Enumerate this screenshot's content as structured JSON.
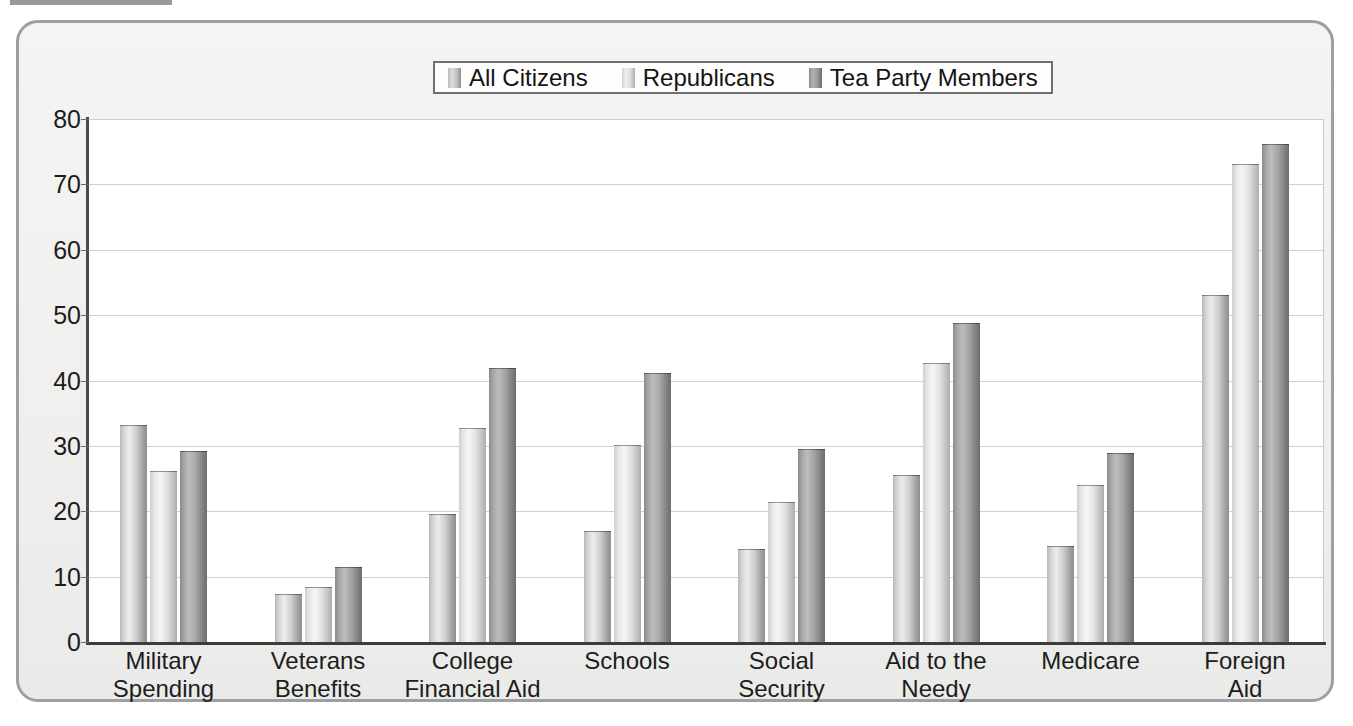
{
  "chart_data": {
    "type": "bar",
    "title": "",
    "xlabel": "",
    "ylabel": "",
    "ylim": [
      0,
      80
    ],
    "yticks": [
      0,
      10,
      20,
      30,
      40,
      50,
      60,
      70,
      80
    ],
    "grid": true,
    "legend_position": "top-center",
    "categories": [
      "Military\nSpending",
      "Veterans\nBenefits",
      "College\nFinancial Aid",
      "Schools",
      "Social\nSecurity",
      "Aid to the\nNeedy",
      "Medicare",
      "Foreign\nAid"
    ],
    "category_labels": [
      {
        "line1": "Military",
        "line2": "Spending"
      },
      {
        "line1": "Veterans",
        "line2": "Benefits"
      },
      {
        "line1": "College",
        "line2": "Financial Aid"
      },
      {
        "line1": "Schools",
        "line2": ""
      },
      {
        "line1": "Social",
        "line2": "Security"
      },
      {
        "line1": "Aid to the",
        "line2": "Needy"
      },
      {
        "line1": "Medicare",
        "line2": ""
      },
      {
        "line1": "Foreign",
        "line2": "Aid"
      }
    ],
    "series": [
      {
        "name": "All Citizens",
        "color": "#c4c4c4",
        "values": [
          33.0,
          7.2,
          19.5,
          16.8,
          14.1,
          25.4,
          14.6,
          53.0
        ]
      },
      {
        "name": "Republicans",
        "color": "#e0e0e0",
        "values": [
          26.0,
          8.3,
          32.6,
          30.0,
          21.2,
          42.5,
          23.8,
          73.0
        ]
      },
      {
        "name": "Tea Party Members",
        "color": "#9a9a9a",
        "values": [
          29.0,
          11.3,
          41.7,
          41.0,
          29.3,
          48.6,
          28.8,
          76.0
        ]
      }
    ]
  },
  "legend": {
    "entries": [
      {
        "label": "All Citizens"
      },
      {
        "label": "Republicans"
      },
      {
        "label": "Tea Party Members"
      }
    ]
  },
  "axis": {
    "y_tick_labels": [
      "80",
      "70",
      "60",
      "50",
      "40",
      "30",
      "20",
      "10",
      "0"
    ]
  }
}
